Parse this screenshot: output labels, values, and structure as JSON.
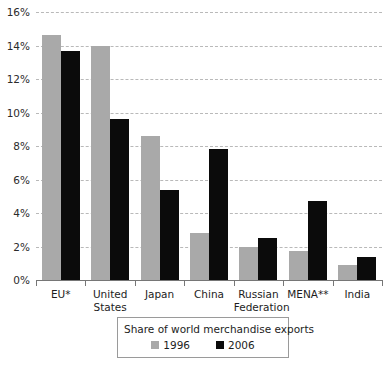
{
  "chart_data": {
    "type": "bar",
    "title": "",
    "subtitle": "",
    "xlabel": "",
    "ylabel": "",
    "ylim": [
      0,
      16
    ],
    "ytick_values": [
      0,
      2,
      4,
      6,
      8,
      10,
      12,
      14,
      16
    ],
    "ytick_labels": [
      "0%",
      "2%",
      "4%",
      "6%",
      "8%",
      "10%",
      "12%",
      "14%",
      "16%"
    ],
    "grid": true,
    "grid_style": "dashed-horizontal",
    "legend_position": "bottom-center",
    "legend_title": "Share of world merchandise exports",
    "categories": [
      "EU*",
      "United\nStates",
      "Japan",
      "China",
      "Russian\nFederation",
      "MENA**",
      "India"
    ],
    "series": [
      {
        "name": "1996",
        "color": "#a9a9a9",
        "values": [
          14.6,
          14.0,
          8.6,
          2.8,
          2.0,
          1.75,
          0.9
        ]
      },
      {
        "name": "2006",
        "color": "#0b0b0b",
        "values": [
          13.7,
          9.6,
          5.4,
          7.8,
          2.5,
          4.7,
          1.4
        ]
      }
    ]
  },
  "footnote": {
    "text": ""
  }
}
